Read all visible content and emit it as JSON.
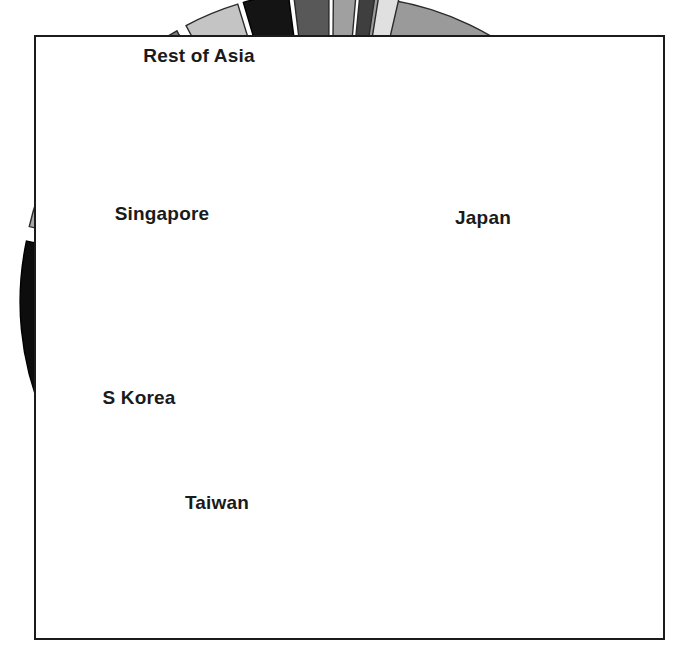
{
  "figure": {
    "background_color": "#ffffff",
    "frame_color": "#1b1b1b",
    "frame": {
      "x": 34,
      "y": 35,
      "width": 631,
      "height": 605
    }
  },
  "chart_data": {
    "type": "pie",
    "title": "",
    "subtitle": "",
    "xlabel": "",
    "ylabel": "",
    "grid": false,
    "legend": "none",
    "exploded": true,
    "label_placement": "inside-slice",
    "center": {
      "x": 330,
      "y": 300
    },
    "radius": 292,
    "explode_offset": 18,
    "start_angle_deg": -86,
    "direction": "clockwise",
    "categories": [
      "Japan",
      "China",
      "Taiwan",
      "S Korea",
      "Hong Kong",
      "Singapore",
      "Rest of Asia",
      "Slice 8",
      "Slice 9",
      "Slice 10",
      "Slice 11",
      "Slice 12",
      "Slice 13"
    ],
    "values": [
      25.0,
      21.0,
      11.0,
      9.2,
      9.7,
      7.0,
      6.1,
      3.1,
      2.6,
      1.9,
      1.4,
      1.0,
      1.0
    ],
    "units": "percent",
    "slices": [
      {
        "label": "Japan",
        "value": 25.0,
        "start_deg": -86,
        "sweep_deg": 90,
        "color": "#9a9a9a",
        "edge_color": "#2a2a2a",
        "label_visible": true,
        "label_color": "label-dark",
        "label_x": 483,
        "label_y": 218
      },
      {
        "label": "China",
        "value": 21.0,
        "start_deg": 5,
        "sweep_deg": 76,
        "color": "#3a3a3a",
        "edge_color": "#1a1a1a",
        "label_visible": true,
        "label_color": "label-light",
        "label_x": 424,
        "label_y": 545
      },
      {
        "label": "Taiwan",
        "value": 11.0,
        "start_deg": 82,
        "sweep_deg": 40,
        "color": "#cfcfcf",
        "edge_color": "#2a2a2a",
        "label_visible": true,
        "label_color": "label-dark",
        "label_x": 217,
        "label_y": 503
      },
      {
        "label": "S Korea",
        "value": 9.2,
        "start_deg": 123,
        "sweep_deg": 33,
        "color": "#e4e4e4",
        "edge_color": "#2a2a2a",
        "label_visible": true,
        "label_color": "label-dark",
        "label_x": 139,
        "label_y": 398
      },
      {
        "label": "Hong Kong",
        "value": 9.7,
        "start_deg": 157,
        "sweep_deg": 35,
        "color": "#0d0d0d",
        "edge_color": "#000000",
        "label_visible": true,
        "label_color": "label-light",
        "label_x": 152,
        "label_y": 303
      },
      {
        "label": "Singapore",
        "value": 7.0,
        "start_deg": 193,
        "sweep_deg": 25,
        "color": "#a8a8a8",
        "edge_color": "#2a2a2a",
        "label_visible": true,
        "label_color": "label-dark",
        "label_x": 162,
        "label_y": 214
      },
      {
        "label": "Rest of Asia",
        "value": 6.1,
        "start_deg": 219,
        "sweep_deg": 22,
        "color": "#7d7d7d",
        "edge_color": "#2a2a2a",
        "label_visible": true,
        "label_color": "label-dark",
        "label_x": 199,
        "label_y": 56
      },
      {
        "label": "Slice 8",
        "value": 3.1,
        "start_deg": 242,
        "sweep_deg": 11,
        "color": "#c4c4c4",
        "edge_color": "#2a2a2a",
        "label_visible": false,
        "label_color": "label-dark",
        "label_x": 0,
        "label_y": 0
      },
      {
        "label": "Slice 9",
        "value": 2.6,
        "start_deg": 253.5,
        "sweep_deg": 9,
        "color": "#141414",
        "edge_color": "#000000",
        "label_visible": false,
        "label_color": "label-light",
        "label_x": 0,
        "label_y": 0
      },
      {
        "label": "Slice 10",
        "value": 1.9,
        "start_deg": 263,
        "sweep_deg": 7,
        "color": "#585858",
        "edge_color": "#2a2a2a",
        "label_visible": false,
        "label_color": "label-light",
        "label_x": 0,
        "label_y": 0
      },
      {
        "label": "Slice 11",
        "value": 1.4,
        "start_deg": 270.5,
        "sweep_deg": 4.5,
        "color": "#a0a0a0",
        "edge_color": "#2a2a2a",
        "label_visible": false,
        "label_color": "label-dark",
        "label_x": 0,
        "label_y": 0
      },
      {
        "label": "Slice 12",
        "value": 1.0,
        "start_deg": 275.5,
        "sweep_deg": 3,
        "color": "#3f3f3f",
        "edge_color": "#2a2a2a",
        "label_visible": false,
        "label_color": "label-light",
        "label_x": 0,
        "label_y": 0
      },
      {
        "label": "Slice 13",
        "value": 1.0,
        "start_deg": 279,
        "sweep_deg": 4,
        "color": "#e0e0e0",
        "edge_color": "#2a2a2a",
        "label_visible": false,
        "label_color": "label-dark",
        "label_x": 0,
        "label_y": 0
      }
    ]
  }
}
